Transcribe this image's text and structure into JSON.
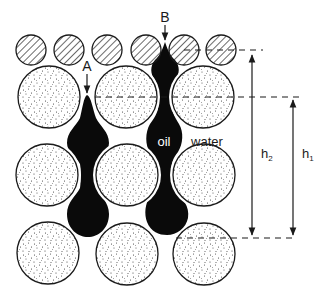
{
  "diagram": {
    "colors": {
      "outline": "#1a1a1a",
      "oil": "#0a0a0a",
      "water": "#ffffff",
      "stipple": "#333333"
    },
    "labels": {
      "point_a": "A",
      "point_b": "B",
      "oil": "oil",
      "water": "water",
      "h1": "h",
      "h1_sub": "1",
      "h2": "h",
      "h2_sub": "2"
    },
    "hatched_grains": [
      {
        "cx": 31,
        "cy": 50,
        "r": 15
      },
      {
        "cx": 69,
        "cy": 50,
        "r": 15
      },
      {
        "cx": 107,
        "cy": 50,
        "r": 15
      },
      {
        "cx": 146,
        "cy": 50,
        "r": 15
      },
      {
        "cx": 184,
        "cy": 50,
        "r": 15
      },
      {
        "cx": 221,
        "cy": 50,
        "r": 15
      }
    ],
    "large_grains": [
      {
        "cx": 49,
        "cy": 97,
        "r": 31
      },
      {
        "cx": 126,
        "cy": 97,
        "r": 31
      },
      {
        "cx": 203,
        "cy": 97,
        "r": 31
      },
      {
        "cx": 47,
        "cy": 175,
        "r": 31
      },
      {
        "cx": 127,
        "cy": 175,
        "r": 31
      },
      {
        "cx": 204,
        "cy": 175,
        "r": 31
      },
      {
        "cx": 48,
        "cy": 253,
        "r": 31
      },
      {
        "cx": 127,
        "cy": 254,
        "r": 31
      },
      {
        "cx": 204,
        "cy": 254,
        "r": 31
      }
    ],
    "reference_lines": [
      {
        "name": "top-level",
        "y": 50,
        "x1": 184,
        "x2": 262
      },
      {
        "name": "middle-level",
        "y": 97,
        "x1": 95,
        "x2": 298
      },
      {
        "name": "bottom-level",
        "y": 238,
        "x1": 175,
        "x2": 295
      }
    ],
    "dimensions": [
      {
        "name": "h2",
        "x": 252,
        "y_top": 52,
        "y_bottom": 237
      },
      {
        "name": "h1",
        "x": 293,
        "y_top": 98,
        "y_bottom": 237
      }
    ]
  }
}
